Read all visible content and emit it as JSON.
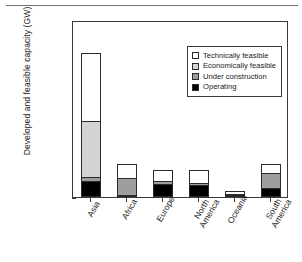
{
  "figure": {
    "top_rule": true
  },
  "chart_data": {
    "type": "bar",
    "title": "",
    "subtitle": "",
    "xlabel": "",
    "ylabel": "Developed and feasible capacity (GW)",
    "ylim": [
      0,
      2500
    ],
    "yticks": [
      0,
      500,
      1000,
      1500,
      2000,
      2500
    ],
    "ytick_labels": [
      "0",
      "500",
      "1000",
      "1500",
      "2000",
      "2500"
    ],
    "grid": false,
    "stacked": true,
    "legend_position": "upper-right",
    "categories": [
      "Asia",
      "Africa",
      "Europe",
      "North America",
      "Oceania",
      "South America"
    ],
    "category_labels": [
      "Asia",
      "Africa",
      "Europe",
      "North\nAmerica",
      "Oceania",
      "South\nAmerica"
    ],
    "series": [
      {
        "name": "Operating",
        "color": "#000000",
        "values": [
          220,
          22,
          185,
          170,
          25,
          125
        ]
      },
      {
        "name": "Under construction",
        "color": "#9e9e9e",
        "values": [
          60,
          245,
          35,
          35,
          12,
          220
        ]
      },
      {
        "name": "Economically feasible",
        "color": "#d4d4d4",
        "values": [
          790,
          0,
          0,
          0,
          0,
          0
        ]
      },
      {
        "name": "Technically feasible",
        "color": "#ffffff",
        "values": [
          960,
          200,
          165,
          175,
          43,
          125
        ]
      }
    ],
    "totals": [
      2030,
      467,
      385,
      380,
      80,
      470
    ],
    "legend_entries": [
      {
        "label": "Technically feasible",
        "color": "#ffffff"
      },
      {
        "label": "Economically feasible",
        "color": "#d4d4d4"
      },
      {
        "label": "Under construction",
        "color": "#9e9e9e"
      },
      {
        "label": "Operating",
        "color": "#000000"
      }
    ]
  }
}
